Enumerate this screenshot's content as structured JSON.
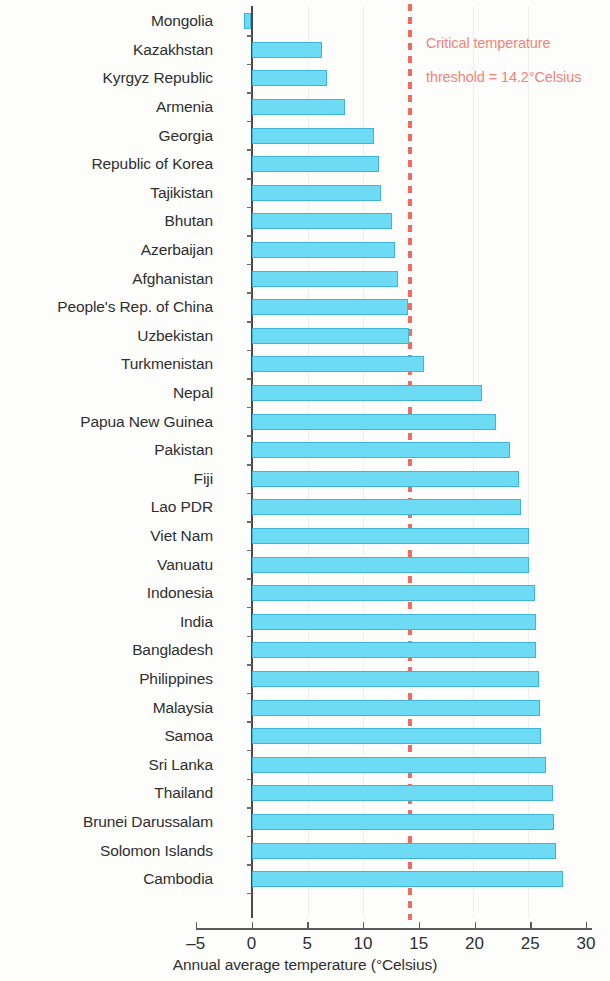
{
  "chart_data": {
    "type": "bar",
    "orientation": "horizontal",
    "title": "",
    "subtitle": "",
    "xlabel": "Annual average temperature (°Celsius)",
    "ylabel": "",
    "xlim": [
      -5,
      30
    ],
    "xticks": [
      -5,
      0,
      5,
      10,
      15,
      20,
      25,
      30
    ],
    "xticklabels": [
      "–5",
      "0",
      "5",
      "10",
      "15",
      "20",
      "25",
      "30"
    ],
    "grid": false,
    "legend": null,
    "bar_color": "#6edbf4",
    "bar_edge_color": "#3fb4d6",
    "categories": [
      "Mongolia",
      "Kazakhstan",
      "Kyrgyz Republic",
      "Armenia",
      "Georgia",
      "Republic of Korea",
      "Tajikistan",
      "Bhutan",
      "Azerbaijan",
      "Afghanistan",
      "People's Rep. of China",
      "Uzbekistan",
      "Turkmenistan",
      "Nepal",
      "Papua New Guinea",
      "Pakistan",
      "Fiji",
      "Lao PDR",
      "Viet Nam",
      "Vanuatu",
      "Indonesia",
      "India",
      "Bangladesh",
      "Philippines",
      "Malaysia",
      "Samoa",
      "Sri Lanka",
      "Thailand",
      "Brunei Darussalam",
      "Solomon Islands",
      "Cambodia"
    ],
    "values": [
      -0.7,
      6.3,
      6.8,
      8.4,
      11.0,
      11.4,
      11.6,
      12.6,
      12.9,
      13.1,
      14.0,
      14.1,
      15.5,
      20.7,
      21.9,
      23.2,
      24.0,
      24.2,
      24.9,
      24.9,
      25.4,
      25.5,
      25.5,
      25.8,
      25.9,
      26.0,
      26.4,
      27.0,
      27.1,
      27.3,
      27.9
    ],
    "annotations": [
      {
        "name": "critical-temperature-threshold",
        "value": 14.2,
        "color": "#f28378",
        "line_color": "#f26b5e",
        "line_style": "dashed",
        "text_line_1": "Critical temperature",
        "text_line_2": "threshold = 14.2°Celsius"
      }
    ]
  }
}
